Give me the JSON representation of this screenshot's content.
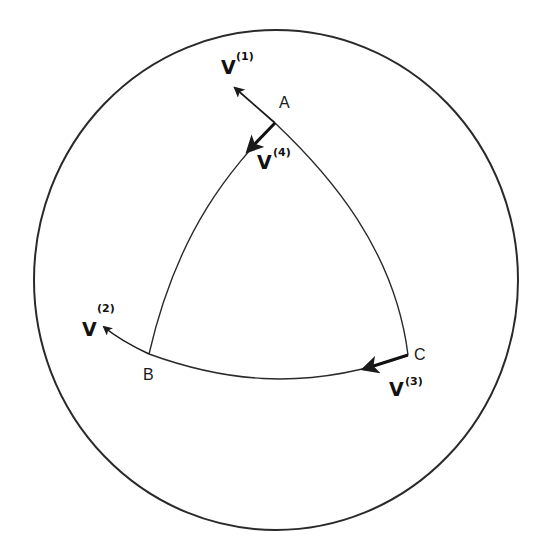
{
  "diagram": {
    "colors": {
      "line": "#2a2a2a",
      "text": "#111111",
      "background": "#ffffff"
    },
    "vertices": {
      "A": {
        "label": "A"
      },
      "B": {
        "label": "B"
      },
      "C": {
        "label": "C"
      }
    },
    "vectors": [
      {
        "id": "v1",
        "symbol": "V",
        "superscript": "(1)",
        "at_vertex": "A",
        "direction": "up-left, tangent to arc AC"
      },
      {
        "id": "v2",
        "symbol": "V",
        "superscript": "(2)",
        "at_vertex": "B",
        "direction": "up-left, tangent to arc BC"
      },
      {
        "id": "v3",
        "symbol": "V",
        "superscript": "(3)",
        "at_vertex": "C",
        "direction": "left, tangent to arc BC"
      },
      {
        "id": "v4",
        "symbol": "V",
        "superscript": "(4)",
        "at_vertex": "A",
        "direction": "down-left, tangent to arc AB"
      }
    ]
  }
}
